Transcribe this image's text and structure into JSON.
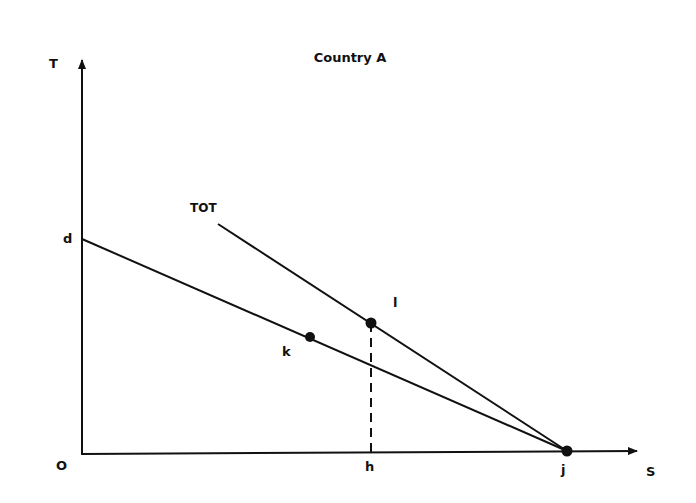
{
  "title": "Country A",
  "axes": {
    "y_label": "T",
    "x_label": "S",
    "origin_label": "O"
  },
  "lines": [
    {
      "name": "budget-line",
      "from": "d",
      "to": "j"
    },
    {
      "name": "tot-line",
      "label": "TOT",
      "to": "j"
    }
  ],
  "points": {
    "d": "d",
    "k": "k",
    "l": "l",
    "h": "h",
    "j": "j"
  },
  "labels": {
    "tot": "TOT"
  },
  "colors": {
    "ink": "#111111",
    "background": "#ffffff"
  }
}
